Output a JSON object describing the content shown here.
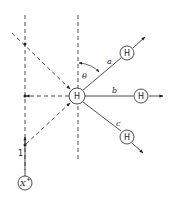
{
  "diagram": {
    "type": "scattering-geometry",
    "central_node": {
      "label": "H",
      "x": 77,
      "y": 96
    },
    "outgoing_nodes": [
      {
        "id": "a",
        "label": "H",
        "branch_label": "a",
        "x": 127,
        "y": 53
      },
      {
        "id": "b",
        "label": "H",
        "branch_label": "b",
        "x": 141,
        "y": 96
      },
      {
        "id": "c",
        "label": "H",
        "branch_label": "c",
        "x": 127,
        "y": 137
      }
    ],
    "projectile_node": {
      "label": "X",
      "superscript": "+",
      "x": 25,
      "y": 183
    },
    "angle_label": "θ",
    "path_label": "1",
    "colors": {
      "stroke": "#222222",
      "background": "#ffffff"
    }
  }
}
